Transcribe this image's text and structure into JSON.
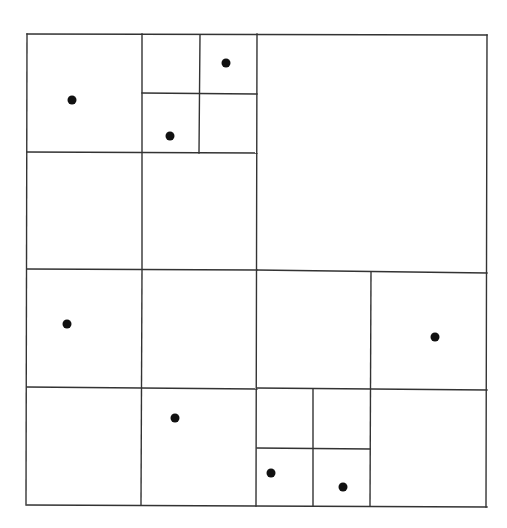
{
  "diagram": {
    "type": "quadtree",
    "line_color": "#333333",
    "point_color": "#111111",
    "bounds": {
      "x0": 27,
      "y0": 34,
      "x1": 487,
      "y1": 506
    },
    "segments": [
      {
        "id": "outer-top",
        "x1": 27,
        "y1": 34,
        "x2": 487,
        "y2": 35
      },
      {
        "id": "outer-bottom",
        "x1": 27,
        "y1": 505,
        "x2": 487,
        "y2": 507
      },
      {
        "id": "outer-left",
        "x1": 27,
        "y1": 34,
        "x2": 26,
        "y2": 505
      },
      {
        "id": "outer-right",
        "x1": 487,
        "y1": 35,
        "x2": 486,
        "y2": 507
      },
      {
        "id": "mid-vertical",
        "x1": 257,
        "y1": 34,
        "x2": 256,
        "y2": 506
      },
      {
        "id": "mid-horizontal-left",
        "x1": 27,
        "y1": 269,
        "x2": 257,
        "y2": 270
      },
      {
        "id": "mid-horizontal-right",
        "x1": 257,
        "y1": 270,
        "x2": 487,
        "y2": 273
      },
      {
        "id": "nw-vertical",
        "x1": 142,
        "y1": 34,
        "x2": 142,
        "y2": 269
      },
      {
        "id": "nw-horizontal",
        "x1": 27,
        "y1": 152,
        "x2": 257,
        "y2": 153
      },
      {
        "id": "nw-ne-vertical",
        "x1": 200,
        "y1": 35,
        "x2": 199,
        "y2": 153
      },
      {
        "id": "nw-ne-horizontal",
        "x1": 142,
        "y1": 93,
        "x2": 257,
        "y2": 94
      },
      {
        "id": "sw-vertical",
        "x1": 142,
        "y1": 270,
        "x2": 141,
        "y2": 505
      },
      {
        "id": "sw-horizontal",
        "x1": 27,
        "y1": 387,
        "x2": 257,
        "y2": 389
      },
      {
        "id": "se-vertical",
        "x1": 371,
        "y1": 272,
        "x2": 370,
        "y2": 506
      },
      {
        "id": "se-horizontal",
        "x1": 257,
        "y1": 388,
        "x2": 487,
        "y2": 390
      },
      {
        "id": "se-sw-vertical",
        "x1": 313,
        "y1": 389,
        "x2": 313,
        "y2": 506
      },
      {
        "id": "se-sw-horizontal",
        "x1": 257,
        "y1": 448,
        "x2": 370,
        "y2": 449
      }
    ],
    "points": [
      {
        "id": "p1",
        "x": 72,
        "y": 100
      },
      {
        "id": "p2",
        "x": 226,
        "y": 63
      },
      {
        "id": "p3",
        "x": 170,
        "y": 136
      },
      {
        "id": "p4",
        "x": 67,
        "y": 324
      },
      {
        "id": "p5",
        "x": 435,
        "y": 337
      },
      {
        "id": "p6",
        "x": 175,
        "y": 418
      },
      {
        "id": "p7",
        "x": 271,
        "y": 473
      },
      {
        "id": "p8",
        "x": 343,
        "y": 487
      }
    ],
    "point_radius": 4.5,
    "line_width": 1.4
  }
}
